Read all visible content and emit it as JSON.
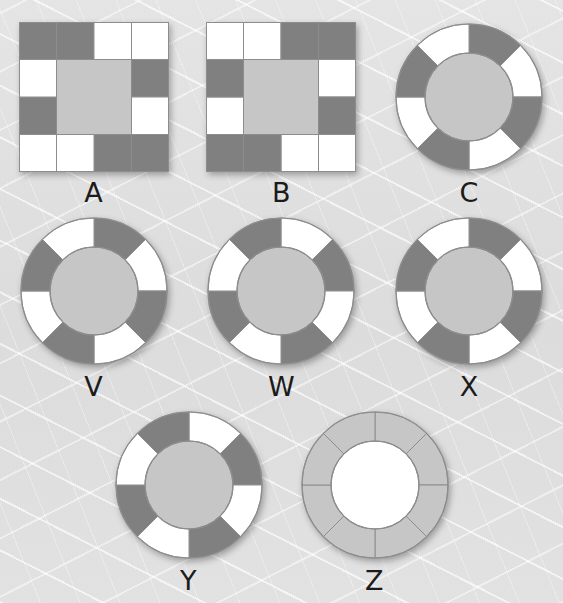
{
  "page": {
    "background_color": "#ededed",
    "width": 563,
    "height": 603
  },
  "palette": {
    "dark_gray": "#808080",
    "light_gray": "#c6c6c6",
    "white": "#ffffff",
    "outline": "#8d8d8d",
    "label_color": "#1b1b1b",
    "background": "#ededed"
  },
  "legend": {
    "segment_color_names": [
      "dark",
      "white",
      "light"
    ]
  },
  "rows": [
    {
      "row_index": 0,
      "items": [
        "A",
        "B",
        "C"
      ]
    },
    {
      "row_index": 1,
      "items": [
        "V",
        "W",
        "X"
      ]
    },
    {
      "row_index": 2,
      "items": [
        "Y",
        "Z"
      ]
    }
  ],
  "figures": [
    {
      "id": "A",
      "label": "A",
      "shape": "square-ring",
      "center_fill": "light",
      "grid": 4,
      "note": "4x4 grid of square tiles with a 2x2 light-gray center; 12 border tiles",
      "border_cells_clockwise_from_top_left": [
        "dark",
        "dark",
        "white",
        "white",
        "dark",
        "white",
        "dark",
        "dark",
        "dark",
        "white",
        "white",
        "dark",
        "white"
      ],
      "cells": [
        {
          "r": 0,
          "c": 0,
          "fill": "dark"
        },
        {
          "r": 0,
          "c": 1,
          "fill": "dark"
        },
        {
          "r": 0,
          "c": 2,
          "fill": "white"
        },
        {
          "r": 0,
          "c": 3,
          "fill": "white"
        },
        {
          "r": 1,
          "c": 3,
          "fill": "dark"
        },
        {
          "r": 2,
          "c": 3,
          "fill": "white"
        },
        {
          "r": 3,
          "c": 3,
          "fill": "dark"
        },
        {
          "r": 3,
          "c": 2,
          "fill": "dark"
        },
        {
          "r": 3,
          "c": 1,
          "fill": "white"
        },
        {
          "r": 3,
          "c": 0,
          "fill": "white"
        },
        {
          "r": 2,
          "c": 0,
          "fill": "dark"
        },
        {
          "r": 1,
          "c": 0,
          "fill": "white"
        }
      ]
    },
    {
      "id": "B",
      "label": "B",
      "shape": "square-ring",
      "center_fill": "light",
      "grid": 4,
      "note": "180-degree rotation of figure A",
      "cells": [
        {
          "r": 0,
          "c": 0,
          "fill": "white"
        },
        {
          "r": 0,
          "c": 1,
          "fill": "white"
        },
        {
          "r": 0,
          "c": 2,
          "fill": "dark"
        },
        {
          "r": 0,
          "c": 3,
          "fill": "dark"
        },
        {
          "r": 1,
          "c": 3,
          "fill": "white"
        },
        {
          "r": 2,
          "c": 3,
          "fill": "dark"
        },
        {
          "r": 3,
          "c": 3,
          "fill": "white"
        },
        {
          "r": 3,
          "c": 2,
          "fill": "white"
        },
        {
          "r": 3,
          "c": 1,
          "fill": "dark"
        },
        {
          "r": 3,
          "c": 0,
          "fill": "dark"
        },
        {
          "r": 2,
          "c": 0,
          "fill": "white"
        },
        {
          "r": 1,
          "c": 0,
          "fill": "dark"
        }
      ]
    },
    {
      "id": "C",
      "label": "C",
      "shape": "circle-ring",
      "center_fill": "light",
      "segments": 8,
      "segment_degrees": 45,
      "start_angle_deg": 0,
      "note": "8-segment annulus; white wedge sits counter-clockwise of 12 o'clock",
      "segment_fills_clockwise_from_top": [
        "dark",
        "white",
        "dark",
        "white",
        "dark",
        "white",
        "dark",
        "white"
      ]
    },
    {
      "id": "V",
      "label": "V",
      "shape": "circle-ring",
      "center_fill": "light",
      "segments": 8,
      "segment_degrees": 45,
      "start_angle_deg": 0,
      "note": "8-segment annulus; white wedge sits counter-clockwise of 12 o'clock",
      "segment_fills_clockwise_from_top": [
        "dark",
        "white",
        "dark",
        "white",
        "dark",
        "white",
        "dark",
        "white"
      ]
    },
    {
      "id": "W",
      "label": "W",
      "shape": "circle-ring",
      "center_fill": "light",
      "segments": 8,
      "segment_degrees": 45,
      "start_angle_deg": 0,
      "note": "8-segment annulus; white wedge sits clockwise of 12 o'clock",
      "segment_fills_clockwise_from_top": [
        "white",
        "dark",
        "white",
        "dark",
        "white",
        "dark",
        "white",
        "dark"
      ]
    },
    {
      "id": "X",
      "label": "X",
      "shape": "circle-ring",
      "center_fill": "light",
      "segments": 8,
      "segment_degrees": 45,
      "start_angle_deg": 0,
      "note": "8-segment annulus; same orientation as C",
      "segment_fills_clockwise_from_top": [
        "dark",
        "white",
        "dark",
        "white",
        "dark",
        "white",
        "dark",
        "white"
      ]
    },
    {
      "id": "Y",
      "label": "Y",
      "shape": "circle-ring",
      "center_fill": "light",
      "segments": 8,
      "segment_degrees": 45,
      "start_angle_deg": 0,
      "note": "8-segment annulus; same orientation as W",
      "segment_fills_clockwise_from_top": [
        "white",
        "dark",
        "white",
        "dark",
        "white",
        "dark",
        "white",
        "dark"
      ]
    },
    {
      "id": "Z",
      "label": "Z",
      "shape": "circle-ring",
      "center_fill": "white",
      "segments": 8,
      "segment_degrees": 45,
      "start_angle_deg": 0,
      "note": "8-segment annulus, all light gray segments, white center hole",
      "segment_fills_clockwise_from_top": [
        "light",
        "light",
        "light",
        "light",
        "light",
        "light",
        "light",
        "light"
      ]
    }
  ]
}
